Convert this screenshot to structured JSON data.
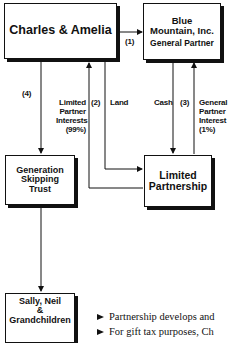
{
  "diagram": {
    "nodes": {
      "charles": {
        "label": "Charles & Amelia"
      },
      "blue_mountain": {
        "line1": "Blue",
        "line2": "Mountain, Inc.",
        "role": "General Partner"
      },
      "gst": {
        "line1": "Generation",
        "line2": "Skipping",
        "line3": "Trust"
      },
      "lp": {
        "line1": "Limited",
        "line2": "Partnership"
      },
      "sally": {
        "line1": "Sally, Neil",
        "line2": "&",
        "line3": "Grandchildren"
      }
    },
    "edges": {
      "e1": {
        "step": "(1)"
      },
      "e2": {
        "step": "(2)",
        "label_lines": [
          "Limited",
          "Partner",
          "Interests",
          "(99%)"
        ]
      },
      "land": {
        "label": "Land"
      },
      "cash": {
        "label": "Cash"
      },
      "e3": {
        "step": "(3)",
        "label_lines": [
          "General",
          "Partner",
          "Interest",
          "(1%)"
        ]
      },
      "e4": {
        "step": "(4)"
      }
    },
    "bullets": [
      "Partnership develops and",
      "For gift tax purposes, Ch"
    ],
    "colors": {
      "ink": "#111111",
      "background": "#ffffff"
    }
  }
}
